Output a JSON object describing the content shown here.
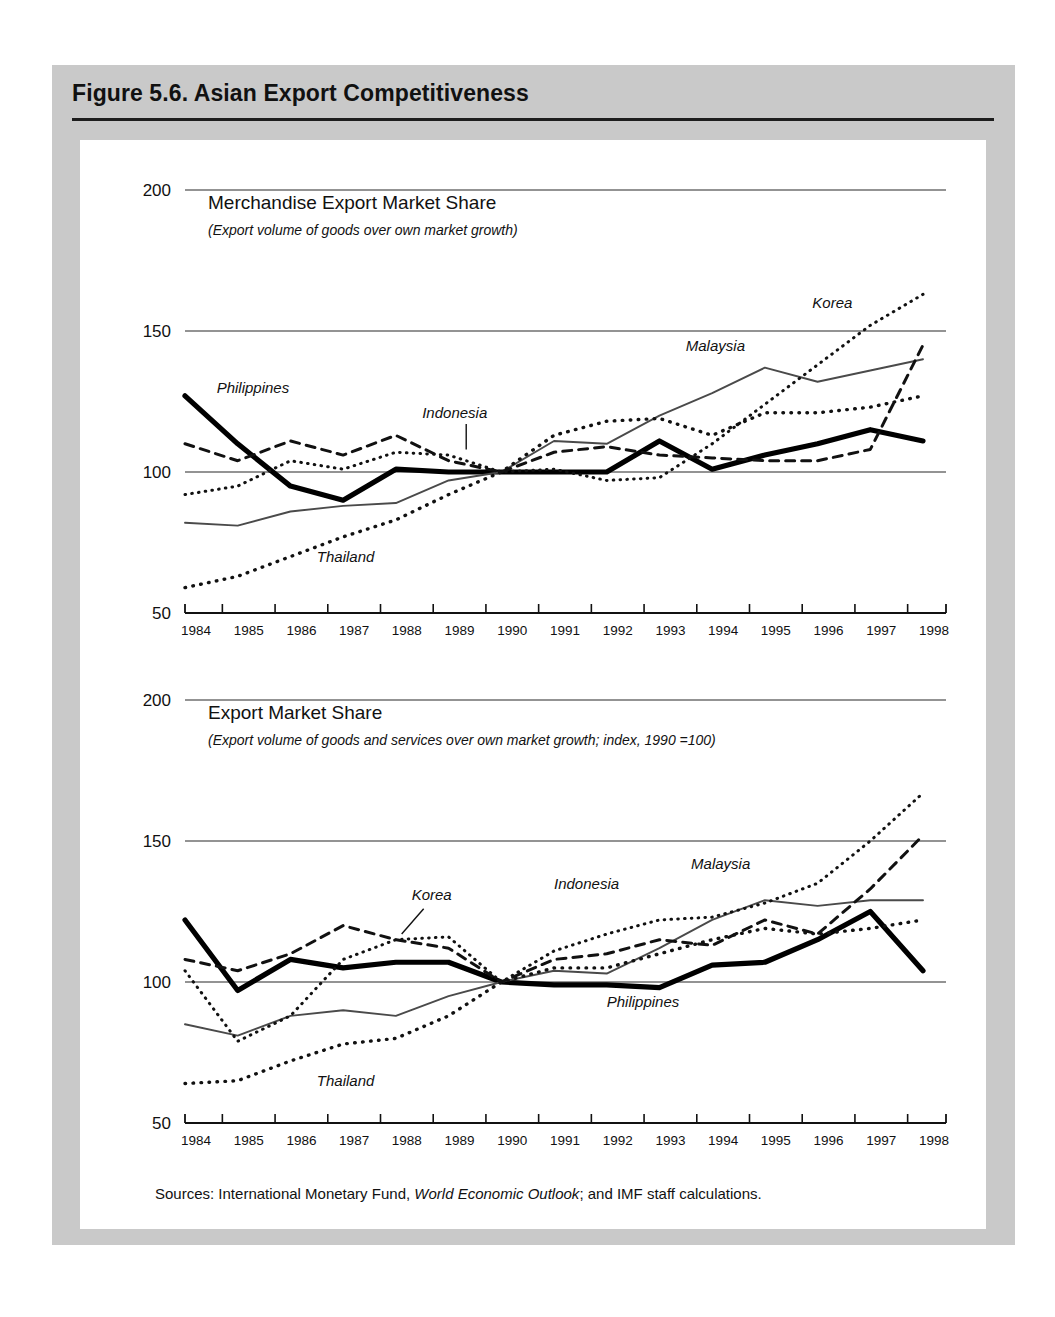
{
  "figure": {
    "title": "Figure 5.6.  Asian Export Competitiveness",
    "sources_prefix": "Sources:  International Monetary Fund, ",
    "sources_italic": "World Economic Outlook",
    "sources_suffix": "; and IMF staff calculations."
  },
  "chart_data": [
    {
      "type": "line",
      "title": "Merchandise Export Market Share",
      "subtitle": "(Export volume of goods over own market growth)",
      "xlabel": "",
      "ylabel": "",
      "x": [
        1984,
        1985,
        1986,
        1987,
        1988,
        1989,
        1990,
        1991,
        1992,
        1993,
        1994,
        1995,
        1996,
        1997,
        1998
      ],
      "xtick_labels": [
        "1984",
        "1985",
        "1986",
        "1987",
        "1988",
        "1989",
        "1990",
        "1991",
        "1992",
        "1993",
        "1994",
        "1995",
        "1996",
        "1997",
        "1998"
      ],
      "ylim": [
        50,
        200
      ],
      "yticks": [
        50,
        100,
        150,
        200
      ],
      "ytick_labels": [
        "50",
        "100",
        "150",
        "200"
      ],
      "grid": true,
      "legend": "inline-labels",
      "series": [
        {
          "name": "Philippines",
          "style": "thick-solid",
          "color": "#000000",
          "values": [
            127,
            110,
            95,
            90,
            101,
            100,
            100,
            100,
            100,
            111,
            101,
            106,
            110,
            115,
            111
          ]
        },
        {
          "name": "Malaysia",
          "style": "thin-solid",
          "color": "#555555",
          "values": [
            82,
            81,
            86,
            88,
            89,
            97,
            100,
            111,
            110,
            120,
            128,
            137,
            132,
            136,
            140
          ]
        },
        {
          "name": "Indonesia",
          "style": "dashed",
          "color": "#111111",
          "values": [
            110,
            104,
            111,
            106,
            113,
            104,
            100,
            107,
            109,
            106,
            105,
            104,
            104,
            108,
            145
          ]
        },
        {
          "name": "Thailand",
          "style": "dotted-coarse",
          "color": "#111111",
          "values": [
            59,
            63,
            70,
            77,
            83,
            92,
            100,
            113,
            118,
            119,
            113,
            121,
            121,
            123,
            127
          ]
        },
        {
          "name": "Korea",
          "style": "dotted-fine",
          "color": "#111111",
          "values": [
            92,
            95,
            104,
            101,
            107,
            106,
            100,
            101,
            97,
            98,
            110,
            124,
            138,
            152,
            163
          ]
        }
      ],
      "annotations": [
        {
          "text": "Philippines",
          "x": 1984.6,
          "y": 128
        },
        {
          "text": "Malaysia",
          "x": 1993.5,
          "y": 143
        },
        {
          "text": "Indonesia",
          "x": 1988.5,
          "y": 119
        },
        {
          "text": "Thailand",
          "x": 1986.5,
          "y": 68
        },
        {
          "text": "Korea",
          "x": 1995.9,
          "y": 158
        }
      ]
    },
    {
      "type": "line",
      "title": "Export Market Share",
      "subtitle": "(Export volume of goods and services over own market growth; index, 1990 =100)",
      "xlabel": "",
      "ylabel": "",
      "x": [
        1984,
        1985,
        1986,
        1987,
        1988,
        1989,
        1990,
        1991,
        1992,
        1993,
        1994,
        1995,
        1996,
        1997,
        1998
      ],
      "xtick_labels": [
        "1984",
        "1985",
        "1986",
        "1987",
        "1988",
        "1989",
        "1990",
        "1991",
        "1992",
        "1993",
        "1994",
        "1995",
        "1996",
        "1997",
        "1998"
      ],
      "ylim": [
        50,
        200
      ],
      "yticks": [
        50,
        100,
        150,
        200
      ],
      "ytick_labels": [
        "50",
        "100",
        "150",
        "200"
      ],
      "grid": true,
      "legend": "inline-labels",
      "series": [
        {
          "name": "Philippines",
          "style": "thick-solid",
          "color": "#000000",
          "values": [
            122,
            97,
            108,
            105,
            107,
            107,
            100,
            99,
            99,
            98,
            106,
            107,
            115,
            125,
            104
          ]
        },
        {
          "name": "Malaysia",
          "style": "thin-solid",
          "color": "#555555",
          "values": [
            85,
            81,
            88,
            90,
            88,
            95,
            100,
            104,
            103,
            112,
            122,
            129,
            127,
            129,
            129
          ]
        },
        {
          "name": "Indonesia",
          "style": "dashed",
          "color": "#111111",
          "values": [
            108,
            104,
            110,
            120,
            115,
            112,
            100,
            108,
            110,
            115,
            113,
            122,
            117,
            133,
            152
          ]
        },
        {
          "name": "Thailand",
          "style": "dotted-coarse",
          "color": "#111111",
          "values": [
            64,
            65,
            72,
            78,
            80,
            88,
            100,
            105,
            105,
            110,
            115,
            119,
            117,
            119,
            122
          ]
        },
        {
          "name": "Korea",
          "style": "dotted-fine",
          "color": "#111111",
          "values": [
            104,
            79,
            88,
            108,
            115,
            116,
            100,
            111,
            117,
            122,
            123,
            128,
            135,
            150,
            167
          ]
        }
      ],
      "annotations": [
        {
          "text": "Korea",
          "x": 1988.3,
          "y": 129
        },
        {
          "text": "Indonesia",
          "x": 1991.0,
          "y": 133
        },
        {
          "text": "Malaysia",
          "x": 1993.6,
          "y": 140
        },
        {
          "text": "Philippines",
          "x": 1992.0,
          "y": 91
        },
        {
          "text": "Thailand",
          "x": 1986.5,
          "y": 63
        }
      ]
    }
  ]
}
